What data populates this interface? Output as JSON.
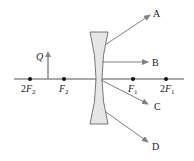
{
  "diagram": {
    "type": "diverging-lens-ray-diagram",
    "object_label": "Q",
    "ray_labels": {
      "A": "A",
      "B": "B",
      "C": "C",
      "D": "D"
    },
    "points": [
      {
        "id": "2F2",
        "prefix": "2",
        "letter": "F",
        "sub": "2",
        "x": 30
      },
      {
        "id": "F2",
        "prefix": "",
        "letter": "F",
        "sub": "2",
        "x": 64
      },
      {
        "id": "F1",
        "prefix": "",
        "letter": "F",
        "sub": "1",
        "x": 133
      },
      {
        "id": "2F1",
        "prefix": "2",
        "letter": "F",
        "sub": "1",
        "x": 166
      }
    ],
    "colors": {
      "axis": "#555555",
      "ray": "#808080",
      "lens_fill": "#e6e6e6",
      "lens_stroke": "#555555",
      "dot": "#111111",
      "object": "#888888"
    }
  }
}
